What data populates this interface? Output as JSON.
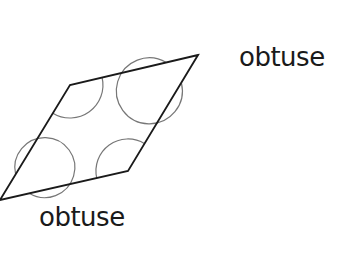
{
  "diagram": {
    "type": "parallelogram-angles",
    "shape": "parallelogram",
    "vertices": {
      "top_right": [
        198,
        55
      ],
      "top_left": [
        70,
        85
      ],
      "bottom_left": [
        0,
        200
      ],
      "bottom_right": [
        128,
        171
      ]
    },
    "angle_markers": [
      {
        "vertex": "top_right",
        "style": "reflex-circle",
        "radius": 33
      },
      {
        "vertex": "top_left",
        "style": "interior-arc",
        "radius": 33
      },
      {
        "vertex": "bottom_right",
        "style": "interior-arc",
        "radius": 32
      },
      {
        "vertex": "bottom_left",
        "style": "reflex-circle",
        "radius": 30
      }
    ],
    "labels": {
      "top": "obtuse",
      "bottom": "obtuse"
    },
    "colors": {
      "edge": "#1a1a1a",
      "arc": "#777777",
      "text": "#1a1a1a",
      "background": "#ffffff"
    }
  }
}
